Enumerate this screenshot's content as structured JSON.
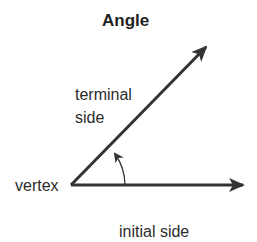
{
  "title": "Angle",
  "labels": {
    "terminal_line1": "terminal",
    "terminal_line2": "side",
    "vertex": "vertex",
    "initial": "initial side"
  },
  "geometry": {
    "vertex": [
      71,
      185
    ],
    "initial_tip": [
      245,
      185
    ],
    "terminal_tip": [
      208,
      45
    ],
    "stroke_color": "#333333"
  }
}
